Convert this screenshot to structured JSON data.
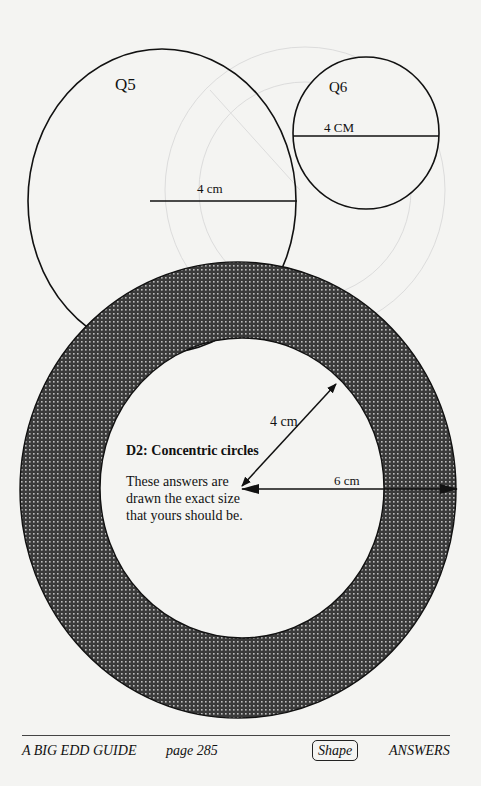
{
  "figures": {
    "q5": {
      "label": "Q5",
      "measure": "4 cm"
    },
    "q6": {
      "label": "Q6",
      "measure": "4 CM"
    },
    "d2": {
      "title": "D2: Concentric circles",
      "description": "These answers  are drawn the exact size that yours should be.",
      "inner_radius_label": "4  cm",
      "outer_radius_label": "6 cm"
    }
  },
  "footer": {
    "book": "A BIG EDD GUIDE",
    "page": "page  285",
    "topic": "Shape",
    "section": "ANSWERS"
  },
  "colors": {
    "ink": "#111111",
    "paper": "#f4f4f2",
    "hatch": "#555555"
  }
}
